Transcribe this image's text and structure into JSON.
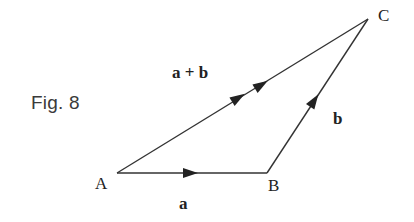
{
  "figure": {
    "caption": "Fig. 8",
    "points": [
      {
        "id": "A",
        "label": "A",
        "x": 117,
        "y": 173
      },
      {
        "id": "B",
        "label": "B",
        "x": 267,
        "y": 173
      },
      {
        "id": "C",
        "label": "C",
        "x": 368,
        "y": 19
      }
    ],
    "vectors": [
      {
        "id": "a",
        "label": "a",
        "from": "A",
        "to": "B",
        "arrowheads": 1
      },
      {
        "id": "b",
        "label": "b",
        "from": "B",
        "to": "C",
        "arrowheads": 1
      },
      {
        "id": "a_plus_b",
        "label": "a + b",
        "from": "A",
        "to": "C",
        "arrowheads": 2
      }
    ],
    "colors": {
      "line": "#333333",
      "text": "#222222",
      "caption": "#3a3a3a",
      "background": "#ffffff"
    }
  }
}
